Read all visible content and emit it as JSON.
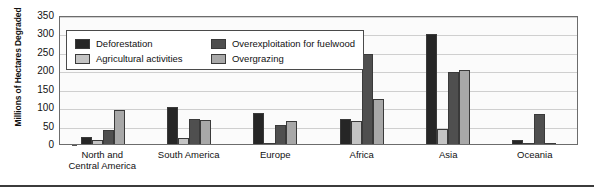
{
  "chart": {
    "type": "bar",
    "ylabel": "Millions of Hectares Degraded",
    "xlabel": ""
  },
  "legend": {
    "items": [
      {
        "label": "Deforestation",
        "color": "#262626",
        "swatch": "legend-swatch-deforestation"
      },
      {
        "label": "Overexploitation for fuelwood",
        "color": "#4f4f4f",
        "swatch": "legend-swatch-overexploitation"
      },
      {
        "label": "Agricultural activities",
        "color": "#c4c4c4",
        "swatch": "legend-swatch-agricultural"
      },
      {
        "label": "Overgrazing",
        "color": "#a8a8a8",
        "swatch": "legend-swatch-overgrazing"
      }
    ]
  },
  "yaxis": {
    "ticks": [
      "350",
      "300",
      "250",
      "200",
      "150",
      "100",
      "50",
      "0"
    ]
  },
  "categories_display": [
    {
      "line1": "North and",
      "line2": "Central America"
    },
    {
      "line1": "South America",
      "line2": ""
    },
    {
      "line1": "Europe",
      "line2": ""
    },
    {
      "line1": "Africa",
      "line2": ""
    },
    {
      "line1": "Asia",
      "line2": ""
    },
    {
      "line1": "Oceania",
      "line2": ""
    }
  ],
  "chart_data": {
    "type": "bar",
    "title": "",
    "xlabel": "",
    "ylabel": "Millions of Hectares Degraded",
    "ylim": [
      0,
      350
    ],
    "yticks": [
      0,
      50,
      100,
      150,
      200,
      250,
      300,
      350
    ],
    "grid": true,
    "legend_position": "inside-top-left",
    "categories": [
      "North and Central America",
      "South America",
      "Europe",
      "Africa",
      "Asia",
      "Oceania"
    ],
    "series": [
      {
        "name": "Deforestation",
        "color": "#262626",
        "values": [
          18,
          100,
          84,
          67,
          298,
          12
        ]
      },
      {
        "name": "Agricultural activities",
        "color": "#c4c4c4",
        "values": [
          11,
          15,
          3,
          62,
          40,
          2
        ]
      },
      {
        "name": "Overexploitation for fuelwood",
        "color": "#4f4f4f",
        "values": [
          38,
          68,
          52,
          245,
          195,
          82
        ]
      },
      {
        "name": "Overgrazing",
        "color": "#a8a8a8",
        "values": [
          92,
          64,
          62,
          122,
          200,
          4
        ]
      }
    ]
  }
}
